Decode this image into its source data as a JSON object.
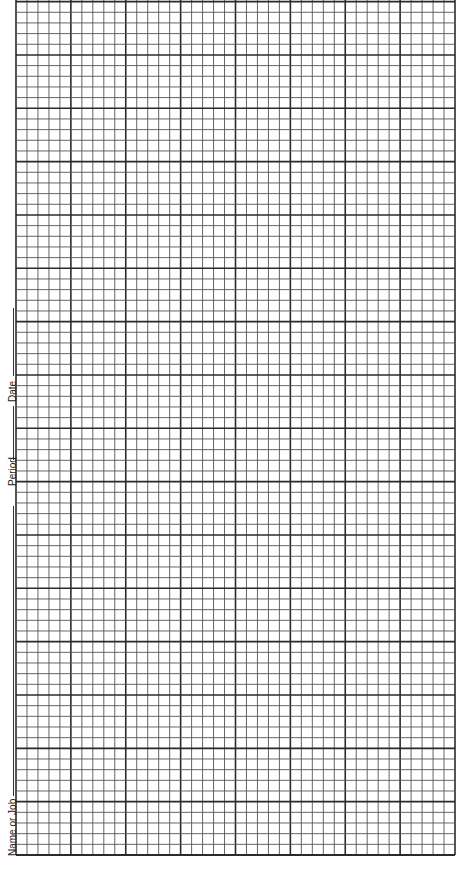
{
  "form": {
    "fields": [
      {
        "label": "Name or Job"
      },
      {
        "label": "Period"
      },
      {
        "label": "Date"
      }
    ]
  },
  "grid": {
    "left": 16,
    "right": 455,
    "top": 1.6,
    "bottom": 855,
    "major_cols": 8,
    "major_rows": 16,
    "minor_per_major": 5,
    "line_color": "#2a2a2a",
    "minor_color": "#555555"
  }
}
